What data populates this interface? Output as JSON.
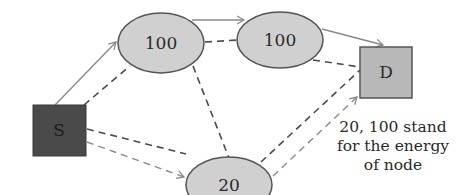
{
  "diagram": {
    "nodes": [
      {
        "id": "S",
        "label": "S",
        "shape": "square",
        "fill": "#4a4a4a"
      },
      {
        "id": "n1",
        "label": "100",
        "shape": "ellipse",
        "fill": "#d0d0d0"
      },
      {
        "id": "n2",
        "label": "100",
        "shape": "ellipse",
        "fill": "#d0d0d0"
      },
      {
        "id": "n3",
        "label": "20",
        "shape": "ellipse",
        "fill": "#d0d0d0"
      },
      {
        "id": "D",
        "label": "D",
        "shape": "square",
        "fill": "#b8b8b8"
      }
    ],
    "edges": [
      {
        "from": "S",
        "to": "n1",
        "style": "solid",
        "arrow": true
      },
      {
        "from": "S",
        "to": "n1",
        "style": "dashed",
        "arrow": false
      },
      {
        "from": "n1",
        "to": "n2",
        "style": "solid",
        "arrow": true
      },
      {
        "from": "n1",
        "to": "n2",
        "style": "dashed",
        "arrow": false
      },
      {
        "from": "n2",
        "to": "D",
        "style": "solid",
        "arrow": true
      },
      {
        "from": "n2",
        "to": "D",
        "style": "dashed",
        "arrow": false
      },
      {
        "from": "n1",
        "to": "n3",
        "style": "dashed",
        "arrow": false
      },
      {
        "from": "S",
        "to": "n3",
        "style": "dashed",
        "arrow": false
      },
      {
        "from": "S",
        "to": "n3",
        "style": "dashed",
        "arrow": true
      },
      {
        "from": "n3",
        "to": "D",
        "style": "dashed",
        "arrow": false
      },
      {
        "from": "n3",
        "to": "D",
        "style": "dashed",
        "arrow": true
      }
    ],
    "caption": {
      "line1": "20, 100 stand",
      "line2": "for the energy",
      "line3": "of node"
    },
    "colors": {
      "stroke": "#555555",
      "solid_edge": "#8a8a8a",
      "dashed_edge": "#4a4a4a",
      "dashed_arrow_edge": "#8a8a8a"
    }
  }
}
